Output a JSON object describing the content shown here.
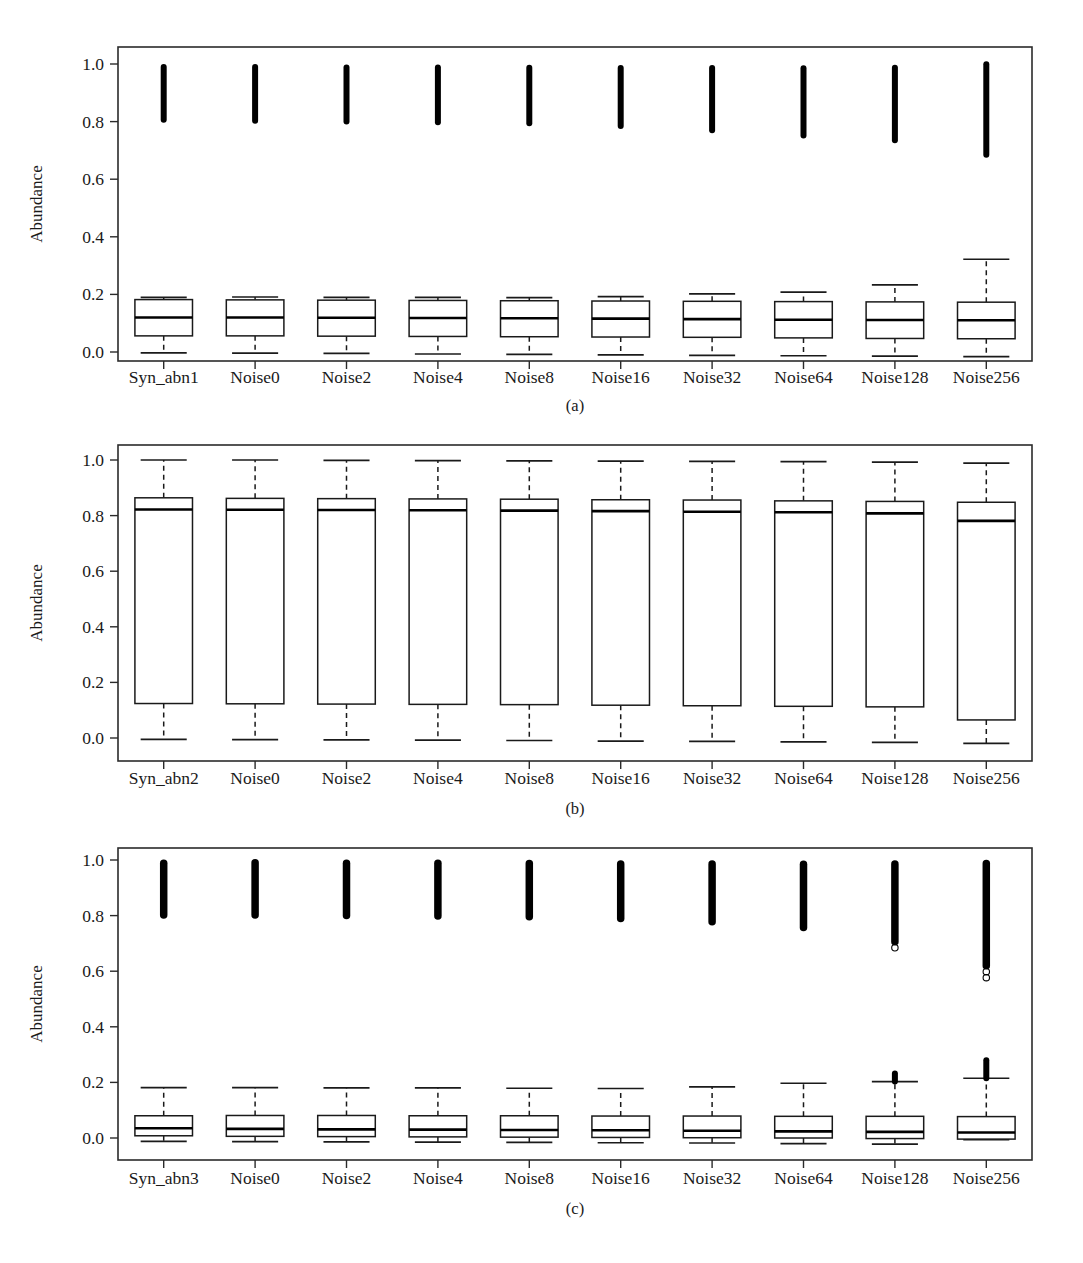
{
  "figure": {
    "ylabel": "Abundance",
    "y_ticks": [
      "0.0",
      "0.2",
      "0.4",
      "0.6",
      "0.8",
      "1.0"
    ],
    "y_tick_values": [
      0.0,
      0.2,
      0.4,
      0.6,
      0.8,
      1.0
    ],
    "ylim": [
      -0.06,
      1.05
    ],
    "panels": [
      "(a)",
      "(b)",
      "(c)"
    ]
  },
  "chart_data": [
    {
      "type": "box",
      "panel": "(a)",
      "title": "",
      "xlabel": "",
      "ylabel": "Abundance",
      "ylim": [
        -0.06,
        1.05
      ],
      "grid": false,
      "legend": "none",
      "categories": [
        "Syn_abn1",
        "Noise0",
        "Noise2",
        "Noise4",
        "Noise8",
        "Noise16",
        "Noise32",
        "Noise64",
        "Noise128",
        "Noise256"
      ],
      "boxes": [
        {
          "label": "Syn_abn1",
          "whisker_low": -0.003,
          "q1": 0.056,
          "median": 0.12,
          "q3": 0.182,
          "whisker_high": 0.19,
          "outlier_band": [
            0.806,
            0.99
          ]
        },
        {
          "label": "Noise0",
          "whisker_low": -0.004,
          "q1": 0.056,
          "median": 0.12,
          "q3": 0.181,
          "whisker_high": 0.191,
          "outlier_band": [
            0.803,
            0.99
          ]
        },
        {
          "label": "Noise2",
          "whisker_low": -0.005,
          "q1": 0.055,
          "median": 0.119,
          "q3": 0.18,
          "whisker_high": 0.19,
          "outlier_band": [
            0.8,
            0.988
          ]
        },
        {
          "label": "Noise4",
          "whisker_low": -0.007,
          "q1": 0.054,
          "median": 0.118,
          "q3": 0.179,
          "whisker_high": 0.19,
          "outlier_band": [
            0.798,
            0.988
          ]
        },
        {
          "label": "Noise8",
          "whisker_low": -0.008,
          "q1": 0.053,
          "median": 0.117,
          "q3": 0.178,
          "whisker_high": 0.189,
          "outlier_band": [
            0.794,
            0.987
          ]
        },
        {
          "label": "Noise16",
          "whisker_low": -0.01,
          "q1": 0.052,
          "median": 0.116,
          "q3": 0.177,
          "whisker_high": 0.192,
          "outlier_band": [
            0.785,
            0.986
          ]
        },
        {
          "label": "Noise32",
          "whisker_low": -0.012,
          "q1": 0.051,
          "median": 0.114,
          "q3": 0.176,
          "whisker_high": 0.202,
          "outlier_band": [
            0.77,
            0.986
          ]
        },
        {
          "label": "Noise64",
          "whisker_low": -0.013,
          "q1": 0.049,
          "median": 0.112,
          "q3": 0.175,
          "whisker_high": 0.208,
          "outlier_band": [
            0.752,
            0.985
          ]
        },
        {
          "label": "Noise128",
          "whisker_low": -0.014,
          "q1": 0.047,
          "median": 0.111,
          "q3": 0.174,
          "whisker_high": 0.233,
          "outlier_band": [
            0.735,
            0.987
          ]
        },
        {
          "label": "Noise256",
          "whisker_low": -0.016,
          "q1": 0.046,
          "median": 0.11,
          "q3": 0.173,
          "whisker_high": 0.322,
          "outlier_band": [
            0.685,
            0.999
          ]
        }
      ]
    },
    {
      "type": "box",
      "panel": "(b)",
      "title": "",
      "xlabel": "",
      "ylabel": "Abundance",
      "ylim": [
        -0.06,
        1.05
      ],
      "grid": false,
      "legend": "none",
      "categories": [
        "Syn_abn2",
        "Noise0",
        "Noise2",
        "Noise4",
        "Noise8",
        "Noise16",
        "Noise32",
        "Noise64",
        "Noise128",
        "Noise256"
      ],
      "boxes": [
        {
          "label": "Syn_abn2",
          "whisker_low": -0.005,
          "q1": 0.124,
          "median": 0.822,
          "q3": 0.864,
          "whisker_high": 1.0,
          "outlier_band": null
        },
        {
          "label": "Noise0",
          "whisker_low": -0.006,
          "q1": 0.123,
          "median": 0.821,
          "q3": 0.862,
          "whisker_high": 1.0,
          "outlier_band": null
        },
        {
          "label": "Noise2",
          "whisker_low": -0.007,
          "q1": 0.122,
          "median": 0.82,
          "q3": 0.861,
          "whisker_high": 0.999,
          "outlier_band": null
        },
        {
          "label": "Noise4",
          "whisker_low": -0.008,
          "q1": 0.121,
          "median": 0.819,
          "q3": 0.86,
          "whisker_high": 0.998,
          "outlier_band": null
        },
        {
          "label": "Noise8",
          "whisker_low": -0.009,
          "q1": 0.12,
          "median": 0.818,
          "q3": 0.859,
          "whisker_high": 0.997,
          "outlier_band": null
        },
        {
          "label": "Noise16",
          "whisker_low": -0.011,
          "q1": 0.118,
          "median": 0.816,
          "q3": 0.857,
          "whisker_high": 0.996,
          "outlier_band": null
        },
        {
          "label": "Noise32",
          "whisker_low": -0.012,
          "q1": 0.116,
          "median": 0.814,
          "q3": 0.856,
          "whisker_high": 0.995,
          "outlier_band": null
        },
        {
          "label": "Noise64",
          "whisker_low": -0.014,
          "q1": 0.114,
          "median": 0.812,
          "q3": 0.853,
          "whisker_high": 0.994,
          "outlier_band": null
        },
        {
          "label": "Noise128",
          "whisker_low": -0.016,
          "q1": 0.112,
          "median": 0.808,
          "q3": 0.851,
          "whisker_high": 0.992,
          "outlier_band": null
        },
        {
          "label": "Noise256",
          "whisker_low": -0.019,
          "q1": 0.065,
          "median": 0.781,
          "q3": 0.848,
          "whisker_high": 0.989,
          "outlier_band": null
        }
      ]
    },
    {
      "type": "box",
      "panel": "(c)",
      "title": "",
      "xlabel": "",
      "ylabel": "Abundance",
      "ylim": [
        -0.06,
        1.05
      ],
      "grid": false,
      "legend": "none",
      "categories": [
        "Syn_abn3",
        "Noise0",
        "Noise2",
        "Noise4",
        "Noise8",
        "Noise16",
        "Noise32",
        "Noise64",
        "Noise128",
        "Noise256"
      ],
      "boxes": [
        {
          "label": "Syn_abn3",
          "whisker_low": -0.012,
          "q1": 0.008,
          "median": 0.035,
          "q3": 0.08,
          "whisker_high": 0.181,
          "outlier_band": [
            0.802,
            0.988
          ],
          "low_outlier_band": null
        },
        {
          "label": "Noise0",
          "whisker_low": -0.013,
          "q1": 0.006,
          "median": 0.033,
          "q3": 0.081,
          "whisker_high": 0.181,
          "outlier_band": [
            0.802,
            0.99
          ],
          "low_outlier_band": null
        },
        {
          "label": "Noise2",
          "whisker_low": -0.014,
          "q1": 0.005,
          "median": 0.031,
          "q3": 0.081,
          "whisker_high": 0.18,
          "outlier_band": [
            0.8,
            0.988
          ],
          "low_outlier_band": null
        },
        {
          "label": "Noise4",
          "whisker_low": -0.015,
          "q1": 0.004,
          "median": 0.03,
          "q3": 0.08,
          "whisker_high": 0.18,
          "outlier_band": [
            0.799,
            0.988
          ],
          "low_outlier_band": null
        },
        {
          "label": "Noise8",
          "whisker_low": -0.016,
          "q1": 0.003,
          "median": 0.029,
          "q3": 0.08,
          "whisker_high": 0.179,
          "outlier_band": [
            0.796,
            0.987
          ],
          "low_outlier_band": null
        },
        {
          "label": "Noise16",
          "whisker_low": -0.017,
          "q1": 0.002,
          "median": 0.028,
          "q3": 0.079,
          "whisker_high": 0.178,
          "outlier_band": [
            0.79,
            0.986
          ],
          "low_outlier_band": null
        },
        {
          "label": "Noise32",
          "whisker_low": -0.018,
          "q1": 0.001,
          "median": 0.026,
          "q3": 0.079,
          "whisker_high": 0.184,
          "outlier_band": [
            0.778,
            0.986
          ],
          "low_outlier_band": null
        },
        {
          "label": "Noise64",
          "whisker_low": -0.02,
          "q1": 0.0,
          "median": 0.024,
          "q3": 0.078,
          "whisker_high": 0.197,
          "outlier_band": [
            0.757,
            0.985
          ],
          "low_outlier_band": null
        },
        {
          "label": "Noise128",
          "whisker_low": -0.022,
          "q1": -0.002,
          "median": 0.022,
          "q3": 0.078,
          "whisker_high": 0.203,
          "outlier_band": [
            0.706,
            0.986
          ],
          "low_outlier_band": [
            0.203,
            0.232
          ]
        },
        {
          "label": "Noise256",
          "whisker_low": -0.006,
          "q1": -0.004,
          "median": 0.02,
          "q3": 0.077,
          "whisker_high": 0.215,
          "outlier_band": [
            0.62,
            0.987
          ],
          "low_outlier_band": [
            0.215,
            0.28
          ]
        }
      ]
    }
  ]
}
